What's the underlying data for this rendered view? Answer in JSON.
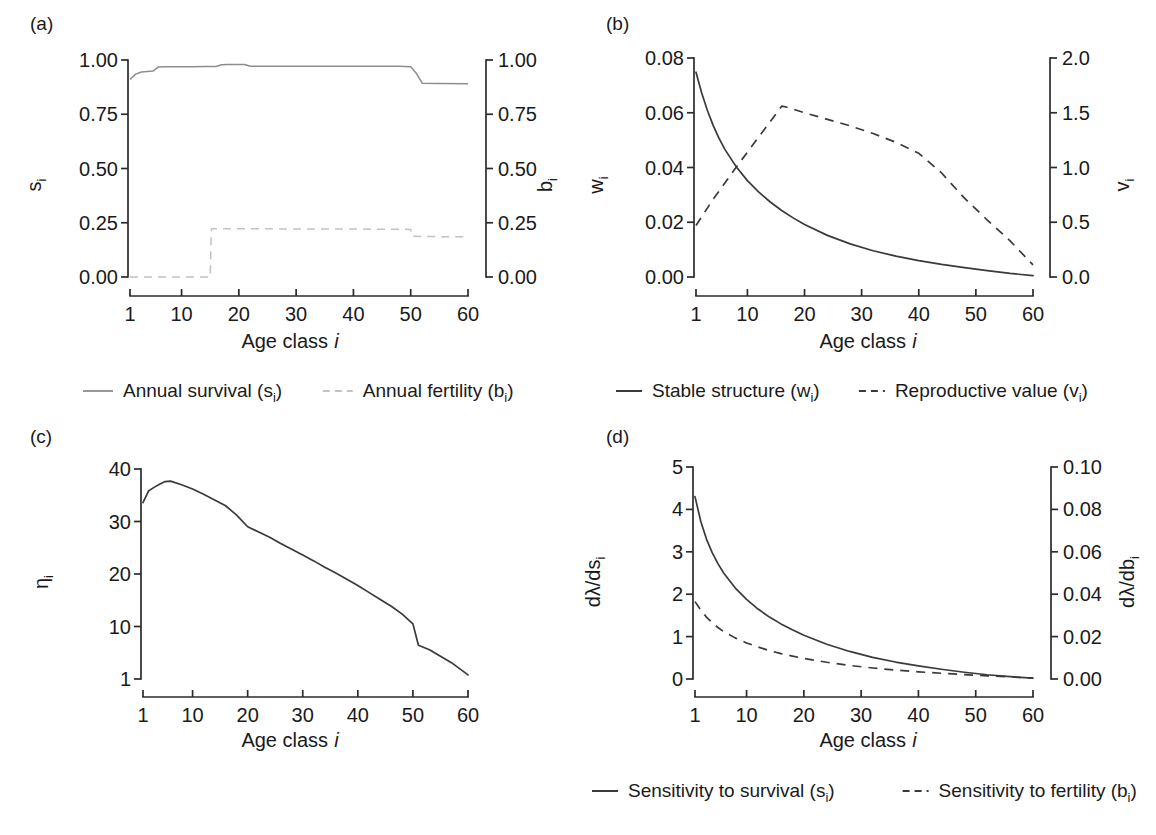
{
  "figure": {
    "panels": [
      "(a)",
      "(b)",
      "(c)",
      "(d)"
    ],
    "shared_xlabel": "Age class",
    "shared_xlabel_italic": "i"
  },
  "chart_data": [
    {
      "id": "a",
      "type": "line",
      "panel_letter": "(a)",
      "title": "",
      "xlabel": "Age class i",
      "ylabel": "sᵢ",
      "ylabel_right": "bᵢ",
      "xlim": [
        1,
        60
      ],
      "ylim": [
        0.0,
        1.0
      ],
      "ylim_right": [
        0.0,
        1.0
      ],
      "xticks": [
        1,
        10,
        20,
        30,
        40,
        50,
        60
      ],
      "xticklabels": [
        "1",
        "10",
        "20",
        "30",
        "40",
        "50",
        "60"
      ],
      "yticks": [
        0.0,
        0.25,
        0.5,
        0.75,
        1.0
      ],
      "yticklabels": [
        "0.00",
        "0.25",
        "0.50",
        "0.75",
        "1.00"
      ],
      "yticks_right": [
        0.0,
        0.25,
        0.5,
        0.75,
        1.0
      ],
      "yticklabels_right": [
        "0.00",
        "0.25",
        "0.50",
        "0.75",
        "1.00"
      ],
      "grid": false,
      "legend_position": "below",
      "series": [
        {
          "name": "Annual survival (sᵢ)",
          "style": "solid",
          "axis": "left",
          "x": [
            1,
            2,
            3,
            4,
            5,
            6,
            7,
            8,
            10,
            12,
            14,
            16,
            17,
            18,
            19,
            20,
            21,
            22,
            24,
            28,
            32,
            36,
            40,
            44,
            48,
            50,
            51,
            52,
            55,
            60
          ],
          "values": [
            0.91,
            0.935,
            0.945,
            0.947,
            0.949,
            0.968,
            0.969,
            0.969,
            0.969,
            0.969,
            0.97,
            0.97,
            0.978,
            0.979,
            0.979,
            0.979,
            0.979,
            0.971,
            0.971,
            0.971,
            0.971,
            0.971,
            0.971,
            0.971,
            0.971,
            0.969,
            0.938,
            0.893,
            0.892,
            0.891
          ]
        },
        {
          "name": "Annual fertility (bᵢ)",
          "style": "dashed",
          "axis": "right",
          "x": [
            1,
            5,
            10,
            14,
            15,
            15.2,
            16,
            20,
            25,
            30,
            35,
            40,
            45,
            49,
            50,
            50.2,
            52,
            55,
            60
          ],
          "values": [
            0.0,
            0.0,
            0.0,
            0.0,
            0.0,
            0.222,
            0.222,
            0.222,
            0.222,
            0.221,
            0.221,
            0.221,
            0.22,
            0.22,
            0.219,
            0.188,
            0.187,
            0.186,
            0.186
          ]
        }
      ]
    },
    {
      "id": "b",
      "type": "line",
      "panel_letter": "(b)",
      "title": "",
      "xlabel": "Age class i",
      "ylabel": "wᵢ",
      "ylabel_right": "vᵢ",
      "xlim": [
        1,
        60
      ],
      "ylim": [
        0.0,
        0.08
      ],
      "ylim_right": [
        0.0,
        2.0
      ],
      "xticks": [
        1,
        10,
        20,
        30,
        40,
        50,
        60
      ],
      "xticklabels": [
        "1",
        "10",
        "20",
        "30",
        "40",
        "50",
        "60"
      ],
      "yticks": [
        0.0,
        0.02,
        0.04,
        0.06,
        0.08
      ],
      "yticklabels": [
        "0.00",
        "0.02",
        "0.04",
        "0.06",
        "0.08"
      ],
      "yticks_right": [
        0.0,
        0.5,
        1.0,
        1.5,
        2.0
      ],
      "yticklabels_right": [
        "0.0",
        "0.5",
        "1.0",
        "1.5",
        "2.0"
      ],
      "grid": false,
      "legend_position": "below",
      "series": [
        {
          "name": "Stable structure (wᵢ)",
          "style": "solid",
          "axis": "left",
          "x": [
            1,
            2,
            3,
            4,
            5,
            6,
            8,
            10,
            12,
            14,
            16,
            18,
            20,
            24,
            28,
            32,
            36,
            40,
            44,
            48,
            52,
            56,
            60
          ],
          "values": [
            0.0748,
            0.0672,
            0.0608,
            0.0554,
            0.0508,
            0.0468,
            0.0404,
            0.0352,
            0.031,
            0.0274,
            0.0243,
            0.0216,
            0.0192,
            0.0152,
            0.0121,
            0.0096,
            0.0076,
            0.006,
            0.0046,
            0.0034,
            0.0023,
            0.0013,
            0.0005
          ]
        },
        {
          "name": "Reproductive value (vᵢ)",
          "style": "dashed",
          "axis": "right",
          "x": [
            1,
            4,
            8,
            12,
            16,
            17,
            20,
            24,
            28,
            32,
            36,
            40,
            44,
            48,
            52,
            56,
            60
          ],
          "values": [
            0.47,
            0.71,
            1.0,
            1.28,
            1.56,
            1.55,
            1.5,
            1.44,
            1.38,
            1.31,
            1.23,
            1.13,
            0.95,
            0.72,
            0.52,
            0.33,
            0.11
          ]
        }
      ]
    },
    {
      "id": "c",
      "type": "line",
      "panel_letter": "(c)",
      "title": "",
      "xlabel": "Age class i",
      "ylabel": "ηᵢ",
      "xlim": [
        1,
        60
      ],
      "ylim": [
        1,
        40
      ],
      "xticks": [
        1,
        10,
        20,
        30,
        40,
        50,
        60
      ],
      "xticklabels": [
        "1",
        "10",
        "20",
        "30",
        "40",
        "50",
        "60"
      ],
      "yticks": [
        1,
        10,
        20,
        30,
        40
      ],
      "yticklabels": [
        "1",
        "10",
        "20",
        "30",
        "40"
      ],
      "grid": false,
      "legend_position": "none",
      "series": [
        {
          "name": "ηᵢ",
          "style": "solid",
          "axis": "left",
          "x": [
            1,
            2,
            3,
            4,
            5,
            6,
            8,
            10,
            12,
            14,
            16,
            18,
            20,
            22,
            24,
            26,
            28,
            30,
            32,
            34,
            36,
            38,
            40,
            42,
            44,
            46,
            48,
            50,
            51,
            53,
            55,
            57,
            60
          ],
          "values": [
            33.6,
            35.8,
            36.5,
            37.1,
            37.6,
            37.7,
            37.0,
            36.2,
            35.2,
            34.1,
            33.0,
            31.2,
            29.0,
            28.0,
            27.0,
            25.8,
            24.7,
            23.6,
            22.5,
            21.3,
            20.2,
            19.0,
            17.8,
            16.5,
            15.2,
            13.9,
            12.4,
            10.5,
            6.8,
            6.0,
            4.9,
            3.8,
            1.7
          ]
        }
      ]
    },
    {
      "id": "d",
      "type": "line",
      "panel_letter": "(d)",
      "title": "",
      "xlabel": "Age class i",
      "ylabel": "dλ/dsᵢ",
      "ylabel_right": "dλ/dbᵢ",
      "xlim": [
        1,
        60
      ],
      "ylim": [
        0,
        5
      ],
      "ylim_right": [
        0.0,
        0.1
      ],
      "xticks": [
        1,
        10,
        20,
        30,
        40,
        50,
        60
      ],
      "xticklabels": [
        "1",
        "10",
        "20",
        "30",
        "40",
        "50",
        "60"
      ],
      "yticks": [
        0,
        1,
        2,
        3,
        4,
        5
      ],
      "yticklabels": [
        "0",
        "1",
        "2",
        "3",
        "4",
        "5"
      ],
      "yticks_right": [
        0.0,
        0.02,
        0.04,
        0.06,
        0.08,
        0.1
      ],
      "yticklabels_right": [
        "0.00",
        "0.02",
        "0.04",
        "0.06",
        "0.08",
        "0.10"
      ],
      "grid": false,
      "legend_position": "below",
      "series": [
        {
          "name": "Sensitivity to survival (sᵢ)",
          "style": "solid",
          "axis": "left",
          "x": [
            1,
            2,
            3,
            4,
            5,
            6,
            8,
            10,
            12,
            14,
            16,
            18,
            20,
            24,
            28,
            32,
            36,
            40,
            44,
            48,
            52,
            56,
            60
          ],
          "values": [
            4.3,
            3.72,
            3.3,
            2.98,
            2.72,
            2.5,
            2.15,
            1.88,
            1.65,
            1.46,
            1.3,
            1.16,
            1.03,
            0.82,
            0.65,
            0.51,
            0.4,
            0.31,
            0.23,
            0.16,
            0.1,
            0.055,
            0.02
          ]
        },
        {
          "name": "Sensitivity to fertility (bᵢ)",
          "style": "dashed",
          "axis": "right",
          "x": [
            1,
            2,
            3,
            4,
            5,
            6,
            8,
            10,
            12,
            14,
            16,
            18,
            20,
            24,
            28,
            32,
            36,
            40,
            44,
            48,
            52,
            56,
            60
          ],
          "values": [
            0.0365,
            0.0325,
            0.0292,
            0.0265,
            0.0243,
            0.0224,
            0.0194,
            0.017,
            0.0151,
            0.0134,
            0.012,
            0.0108,
            0.0097,
            0.0079,
            0.0064,
            0.0052,
            0.0042,
            0.0034,
            0.0027,
            0.0021,
            0.0015,
            0.001,
            0.0004
          ]
        }
      ]
    }
  ],
  "panel_a": {
    "letter": "(a)",
    "ylabel": "s",
    "ylabel_sub": "i",
    "ylabel_right": "b",
    "ylabel_right_sub": "i",
    "xlabel": "Age class",
    "xlabel_italic": "i",
    "legend": [
      {
        "label": "Annual survival (s",
        "sub": "i",
        "tail": ")",
        "style": "solid"
      },
      {
        "label": "Annual fertility (b",
        "sub": "i",
        "tail": ")",
        "style": "dashed"
      }
    ]
  },
  "panel_b": {
    "letter": "(b)",
    "ylabel": "w",
    "ylabel_sub": "i",
    "ylabel_right": "v",
    "ylabel_right_sub": "i",
    "xlabel": "Age class",
    "xlabel_italic": "i",
    "legend": [
      {
        "label": "Stable structure (w",
        "sub": "i",
        "tail": ")",
        "style": "solid"
      },
      {
        "label": "Reproductive value (v",
        "sub": "i",
        "tail": ")",
        "style": "dashed"
      }
    ]
  },
  "panel_c": {
    "letter": "(c)",
    "ylabel": "η",
    "ylabel_sub": "i",
    "xlabel": "Age class",
    "xlabel_italic": "i"
  },
  "panel_d": {
    "letter": "(d)",
    "ylabel": "dλ/ds",
    "ylabel_sub": "i",
    "ylabel_right": "dλ/db",
    "ylabel_right_sub": "i",
    "xlabel": "Age class",
    "xlabel_italic": "i",
    "legend": [
      {
        "label": "Sensitivity to survival (s",
        "sub": "i",
        "tail": ")",
        "style": "solid"
      },
      {
        "label": "Sensitivity to fertility (b",
        "sub": "i",
        "tail": ")",
        "style": "dashed"
      }
    ]
  },
  "colors": {
    "axis": "#2b2b2b",
    "series_dark": "#3a3a3a",
    "series_faint_solid": "#8d8d8d",
    "series_faint_dashed": "#c2c2c2",
    "background": "#ffffff"
  }
}
